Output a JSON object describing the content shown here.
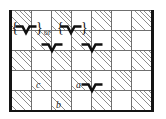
{
  "figure": {
    "colors": {
      "background": "#ffffff",
      "hatch_line": "#8d8d8d",
      "grid_line": "#6f6f6f",
      "border": "#141414",
      "glyph": "#111111",
      "label_text": "#2b2b2b"
    }
  },
  "grid": {
    "columns": 7,
    "rows": 5,
    "cell_size_px": 20,
    "origin": {
      "x": 11,
      "y": 10
    },
    "pattern": "alternating-diagonal-hatch",
    "hatched_cells": [
      [
        0,
        0
      ],
      [
        0,
        2
      ],
      [
        0,
        4
      ],
      [
        0,
        6
      ],
      [
        1,
        1
      ],
      [
        1,
        3
      ],
      [
        1,
        5
      ],
      [
        2,
        0
      ],
      [
        2,
        2
      ],
      [
        2,
        4
      ],
      [
        2,
        6
      ],
      [
        3,
        1
      ],
      [
        3,
        3
      ],
      [
        3,
        5
      ],
      [
        4,
        0
      ],
      [
        4,
        2
      ],
      [
        4,
        4
      ],
      [
        4,
        6
      ]
    ]
  },
  "borders": {
    "left": true,
    "right": true,
    "bottom": true,
    "top": false
  },
  "glyphs": {
    "chevron_symbol": "chevron-down-notch",
    "items": [
      {
        "name": "chevron-bracketed-left",
        "x": 13,
        "y": 26,
        "bracketed": true
      },
      {
        "name": "chevron-bracketed-right",
        "x": 45,
        "y": 26,
        "bracketed": true
      },
      {
        "name": "chevron-row2-col2",
        "x": 45,
        "y": 58,
        "bracketed": false
      },
      {
        "name": "chevron-row2-col4",
        "x": 85,
        "y": 58,
        "bracketed": false
      },
      {
        "name": "chevron-row4-col4",
        "x": 85,
        "y": 98,
        "bracketed": false
      }
    ]
  },
  "brackets": {
    "left_open": "{",
    "left_close": "}",
    "right_open": "{",
    "right_close": "}"
  },
  "text": {
    "connective": "or"
  },
  "labels": [
    {
      "name": "label-c",
      "text": "c",
      "x": 55,
      "y": 82
    },
    {
      "name": "label-a",
      "text": "a",
      "x": 95,
      "y": 82
    },
    {
      "name": "label-b",
      "text": "b",
      "x": 75,
      "y": 102
    }
  ]
}
